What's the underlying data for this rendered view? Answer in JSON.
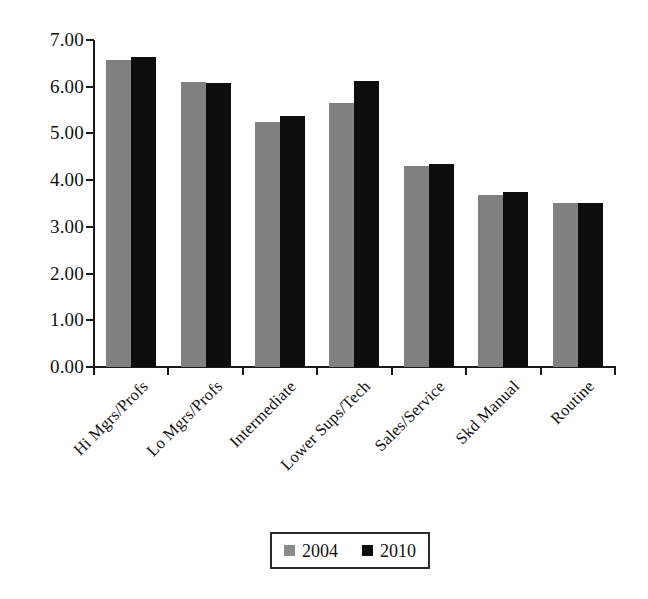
{
  "chart_data": {
    "type": "bar",
    "title": "",
    "subtitle": "",
    "xlabel": "",
    "ylabel": "",
    "ylim": [
      0,
      7
    ],
    "ytick_step": 1,
    "grid": false,
    "legend_position": "bottom",
    "categories": [
      "Hi Mgrs/Profs",
      "Lo Mgrs/Profs",
      "Intermediate",
      "Lower Sups/Tech",
      "Sales/Service",
      "Skd Manual",
      "Routine"
    ],
    "ytick_labels": [
      "0.00",
      "1.00",
      "2.00",
      "3.00",
      "4.00",
      "5.00",
      "6.00",
      "7.00"
    ],
    "ytick_values": [
      0,
      1,
      2,
      3,
      4,
      5,
      6,
      7
    ],
    "series": [
      {
        "name": "2004",
        "color": "#808080",
        "values": [
          6.58,
          6.1,
          5.25,
          5.65,
          4.3,
          3.68,
          3.51
        ]
      },
      {
        "name": "2010",
        "color": "#0d0d0d",
        "values": [
          6.63,
          6.07,
          5.38,
          6.12,
          4.34,
          3.74,
          3.51
        ]
      }
    ]
  },
  "legend": {
    "entries": [
      {
        "label": "2004",
        "swatch": "gray-swatch-icon"
      },
      {
        "label": "2010",
        "swatch": "black-swatch-icon"
      }
    ]
  }
}
